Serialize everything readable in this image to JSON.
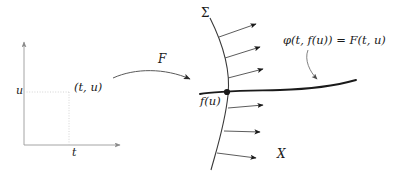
{
  "figure": {
    "background_color": "#ffffff",
    "ink_color": "#1a1a1a",
    "guide_color": "#c9c9c9",
    "width": 405,
    "height": 178
  },
  "domain_plot": {
    "y_axis_label": "u",
    "x_axis_label": "t",
    "point_label": "(t, u)",
    "axis_origin": {
      "x": 24,
      "y": 145
    },
    "point": {
      "x": 69,
      "y": 92
    },
    "guide_style": "dotted"
  },
  "map_arrow": {
    "label": "F",
    "from": {
      "x": 113,
      "y": 78
    },
    "to": {
      "x": 192,
      "y": 81
    }
  },
  "surface": {
    "curve_label": "Σ",
    "base_point_label": "f(u)",
    "vector_field_label": "X",
    "base_point": {
      "x": 227,
      "y": 92
    },
    "arrow_count": 6
  },
  "orbit": {
    "equation": "φ(t, f(u)) = F(t, u)",
    "leader_from": {
      "x": 310,
      "y": 50
    },
    "leader_to": {
      "x": 318,
      "y": 80
    }
  }
}
